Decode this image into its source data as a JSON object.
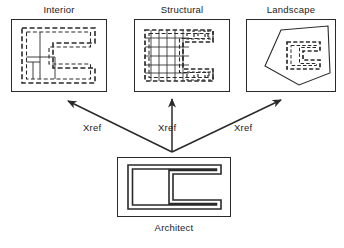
{
  "diagram": {
    "type": "xref-relationship-diagram",
    "background_color": "#ffffff",
    "line_color": "#2a2a2a",
    "text_color": "#1a1a1a"
  },
  "panels": {
    "interior": {
      "label": "Interior",
      "drawing_description": "dashed C-shaped floor plan with solid interior partition walls",
      "box": {
        "x": 11,
        "y": 19,
        "width": 96,
        "height": 73
      }
    },
    "structural": {
      "label": "Structural",
      "drawing_description": "dashed C-shaped outline overlaid with structural column and beam grid",
      "box": {
        "x": 134,
        "y": 19,
        "width": 96,
        "height": 73
      }
    },
    "landscape": {
      "label": "Landscape",
      "drawing_description": "solid site boundary polygon containing a small dashed C-shaped building footprint",
      "box": {
        "x": 246,
        "y": 19,
        "width": 90,
        "height": 73
      }
    },
    "architect": {
      "label": "Architect",
      "drawing_description": "bold solid double-line C-shaped master building plan",
      "box": {
        "x": 117,
        "y": 157,
        "width": 114,
        "height": 60
      }
    }
  },
  "arrows": [
    {
      "label": "Xref",
      "from": "architect",
      "to": "interior",
      "direction": "up-left"
    },
    {
      "label": "Xref",
      "from": "architect",
      "to": "structural",
      "direction": "up"
    },
    {
      "label": "Xref",
      "from": "architect",
      "to": "landscape",
      "direction": "up-right"
    }
  ],
  "arrow_origin": {
    "x": 172,
    "y": 152
  }
}
